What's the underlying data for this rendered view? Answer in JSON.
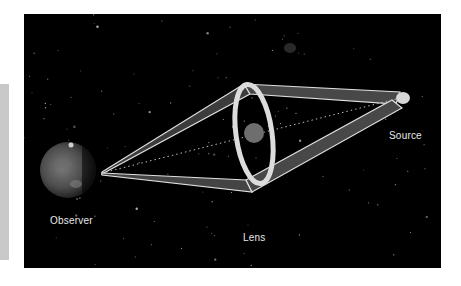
{
  "diagram": {
    "labels": {
      "observer": "Observer",
      "lens": "Lens",
      "source": "Source"
    },
    "colors": {
      "background": "#000000",
      "light_band_fill": "#4a4a4a",
      "light_band_edge": "#e0e0e0",
      "einstein_ring": "#dcdcdc",
      "lens_body": "#6e6e6e",
      "source": "#d8d8d8",
      "stars": "#bdbdbd",
      "planet": "#5a5a5a"
    }
  }
}
